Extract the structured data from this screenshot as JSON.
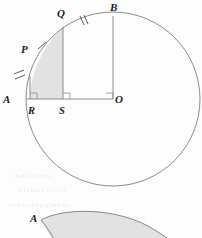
{
  "figure": {
    "background_color": "#fdfdfd",
    "stroke_color": "#6f6f6f",
    "shade_color": "#e2e2e2",
    "label_color": "#1c1c1c"
  },
  "main_diagram": {
    "name": "circle-diagram",
    "circle": {
      "center_label": "O",
      "cx": 113,
      "cy": 99,
      "r": 87
    },
    "labels": [
      {
        "id": "B",
        "text": "B",
        "x": 110,
        "y": 11
      },
      {
        "id": "Q",
        "text": "Q",
        "x": 57,
        "y": 17
      },
      {
        "id": "P",
        "text": "P",
        "x": 21,
        "y": 53
      },
      {
        "id": "A",
        "text": "A",
        "x": 3,
        "y": 103
      },
      {
        "id": "R",
        "text": "R",
        "x": 28,
        "y": 114
      },
      {
        "id": "S",
        "text": "S",
        "x": 59,
        "y": 114
      },
      {
        "id": "O",
        "text": "O",
        "x": 115,
        "y": 103
      }
    ],
    "points": [
      {
        "id": "A",
        "x": 26,
        "y": 99
      },
      {
        "id": "R",
        "x": 30,
        "y": 99
      },
      {
        "id": "S",
        "x": 63,
        "y": 99
      },
      {
        "id": "O",
        "x": 113,
        "y": 99
      },
      {
        "id": "B",
        "x": 113,
        "y": 16
      },
      {
        "id": "Q",
        "x": 63,
        "y": 27
      },
      {
        "id": "P",
        "x": 33,
        "y": 48
      }
    ],
    "segments": [
      {
        "name": "base-line-A-O",
        "from": "A",
        "to": "O"
      },
      {
        "name": "vertical-line-Q-S",
        "from": "Q",
        "to": "S"
      },
      {
        "name": "vertical-line-B-O",
        "from": "B",
        "to": "O"
      },
      {
        "name": "vertical-line-R",
        "from": "R",
        "to": "arc"
      }
    ],
    "right_angle_marks": [
      {
        "name": "right-angle-at-R",
        "x": 30,
        "y": 99
      },
      {
        "name": "right-angle-at-S",
        "x": 63,
        "y": 99
      },
      {
        "name": "right-angle-at-O",
        "x": 113,
        "y": 99
      }
    ],
    "tick_marks": [
      {
        "name": "tick-arc-A-P",
        "count": 2,
        "arc_segment": "A to P"
      },
      {
        "name": "tick-arc-P-Q",
        "count": 1,
        "arc_segment": "P to Q"
      },
      {
        "name": "tick-arc-Q-B",
        "count": 2,
        "arc_segment": "Q to B"
      }
    ],
    "shaded_region": {
      "name": "shaded-region-RQS",
      "description": "Region bounded by arc from R up to Q, vertical line Q-S, and base R-S"
    }
  },
  "bottom_diagram": {
    "name": "crescent-diagram",
    "labels": [
      {
        "id": "A",
        "text": "A",
        "x": 30,
        "y": 222
      }
    ],
    "shaded_region": {
      "name": "shaded-crescent",
      "description": "Lens shaped shaded region with pointed tip at A"
    }
  }
}
